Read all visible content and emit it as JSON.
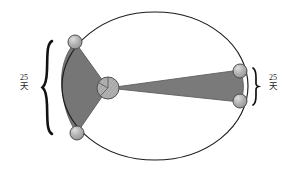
{
  "figure": {
    "title_present": false,
    "background_color": "#ffffff",
    "orbit": {
      "name": "elliptical-orbit",
      "stroke_color": "#1a1a1a",
      "fill": "none",
      "center_x": 155,
      "center_y": 86,
      "radius_x": 93,
      "radius_y": 74
    },
    "sun": {
      "name": "sun",
      "center_x": 108,
      "center_y": 88,
      "radius": 11,
      "fill_color": "#a8a8a8",
      "stroke_color": "#4a4a4a"
    },
    "sectors": [
      {
        "name": "near-sector",
        "side": "left",
        "fill_color": "#777777",
        "stroke_color": "#555555",
        "label": "25 天"
      },
      {
        "name": "far-sector",
        "side": "right",
        "fill_color": "#7b7b7b",
        "stroke_color": "#5a5a5a",
        "label": "25 天"
      }
    ],
    "planets": [
      {
        "name": "planet-top-left",
        "x": 75,
        "y": 42,
        "radius": 7
      },
      {
        "name": "planet-bottom-left",
        "x": 77,
        "y": 133,
        "radius": 7
      },
      {
        "name": "planet-top-right",
        "x": 240,
        "y": 71,
        "radius": 7
      },
      {
        "name": "planet-bottom-right",
        "x": 240,
        "y": 101,
        "radius": 7
      }
    ],
    "planet_style": {
      "fill_color": "#9a9a9a",
      "highlight_color": "#cfcfcf",
      "stroke_color": "#4a4a4a"
    }
  },
  "labels": {
    "left": {
      "number": "25",
      "unit": "天",
      "brace_name": "left-brace",
      "brace_span_top": 42,
      "brace_span_bottom": 133
    },
    "right": {
      "number": "25",
      "unit": "天",
      "brace_name": "right-brace",
      "brace_span_top": 69,
      "brace_span_bottom": 104
    }
  }
}
